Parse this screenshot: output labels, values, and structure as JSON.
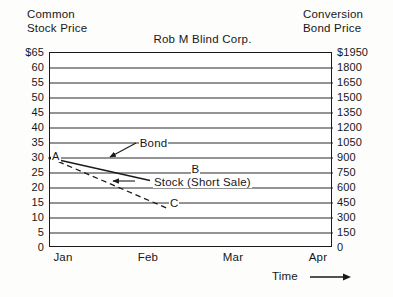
{
  "chart_data": {
    "type": "line",
    "title": "Rob M Blind Corp.",
    "xlabel": "Time",
    "ylabel": "Common Stock Price",
    "y2label": "Conversion Bond Price",
    "grid": true,
    "legend_position": "inline-annotations",
    "x_categories": [
      "Jan",
      "Feb",
      "Mar",
      "Apr"
    ],
    "xlim": [
      0,
      3
    ],
    "ylim": [
      0,
      65
    ],
    "y2lim": [
      0,
      1950
    ],
    "y_ticks": [
      65,
      60,
      55,
      50,
      45,
      40,
      35,
      30,
      25,
      20,
      15,
      10,
      5,
      0
    ],
    "y_tick_labels": [
      "$65",
      "60",
      "55",
      "50",
      "45",
      "40",
      "35",
      "30",
      "25",
      "20",
      "15",
      "10",
      "5",
      "0"
    ],
    "y2_ticks": [
      1950,
      1800,
      1650,
      1500,
      1350,
      1200,
      1050,
      900,
      750,
      600,
      450,
      300,
      150,
      0
    ],
    "y2_tick_labels": [
      "$1950",
      "1800",
      "1650",
      "1500",
      "1350",
      "1200",
      "1050",
      "900",
      "750",
      "600",
      "450",
      "300",
      "150",
      "0"
    ],
    "series": [
      {
        "name": "Bond",
        "style": "solid",
        "start_label": "A",
        "end_label": "B",
        "x": [
          0,
          1.06
        ],
        "values": [
          30,
          22.5
        ]
      },
      {
        "name": "Stock (Short Sale)",
        "style": "dashed",
        "start_label": "A",
        "end_label": "C",
        "x": [
          0,
          1.26
        ],
        "values": [
          30,
          13
        ]
      }
    ],
    "annotations": [
      {
        "text": "A",
        "x": 0,
        "y": 30
      },
      {
        "text": "Bond",
        "x": 0.93,
        "y": 34.2
      },
      {
        "text": "B",
        "x": 1.48,
        "y": 25.6
      },
      {
        "text": "Stock (Short Sale)",
        "x": 1.08,
        "y": 21.4
      },
      {
        "text": "C",
        "x": 1.25,
        "y": 14.4
      }
    ]
  },
  "header": {
    "left_axis_line1": "Common",
    "left_axis_line2": "Stock Price",
    "right_axis_line1": "Conversion",
    "right_axis_line2": "Bond Price",
    "title": "Rob M Blind Corp."
  },
  "footer": {
    "time_caption": "Time"
  },
  "labels": {
    "point_a": "A",
    "point_b": "B",
    "point_c": "C",
    "bond": "Bond",
    "stock": "Stock (Short Sale)"
  },
  "colors": {
    "axis": "#1a1a1a",
    "gridline": "#2b2b2b",
    "text": "#17171a",
    "background": "#fdfdfc",
    "plot_background": "#ffffff"
  }
}
